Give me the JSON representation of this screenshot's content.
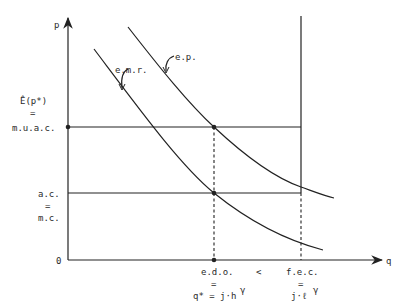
{
  "axes": {
    "y_label": "p",
    "x_label": "q",
    "origin_label": "0"
  },
  "y_ticks": {
    "upper": {
      "line1": "Ê(p*)",
      "eq": "=",
      "line2": "m.u.a.c."
    },
    "lower": {
      "line1": "a.c.",
      "eq": "=",
      "line2": "m.c."
    }
  },
  "x_ticks": {
    "left": {
      "line1": "e.d.o.",
      "eq": "=",
      "line2": "q* = j·h",
      "sup": "γ"
    },
    "relation": "<",
    "right": {
      "line1": "f.e.c.",
      "eq": "=",
      "line2": "j·ℓ",
      "sup": "γ"
    }
  },
  "curves": {
    "emr": "e.m.r.",
    "ep": "e.p."
  },
  "colors": {
    "ink": "#222222",
    "background": "#ffffff"
  }
}
